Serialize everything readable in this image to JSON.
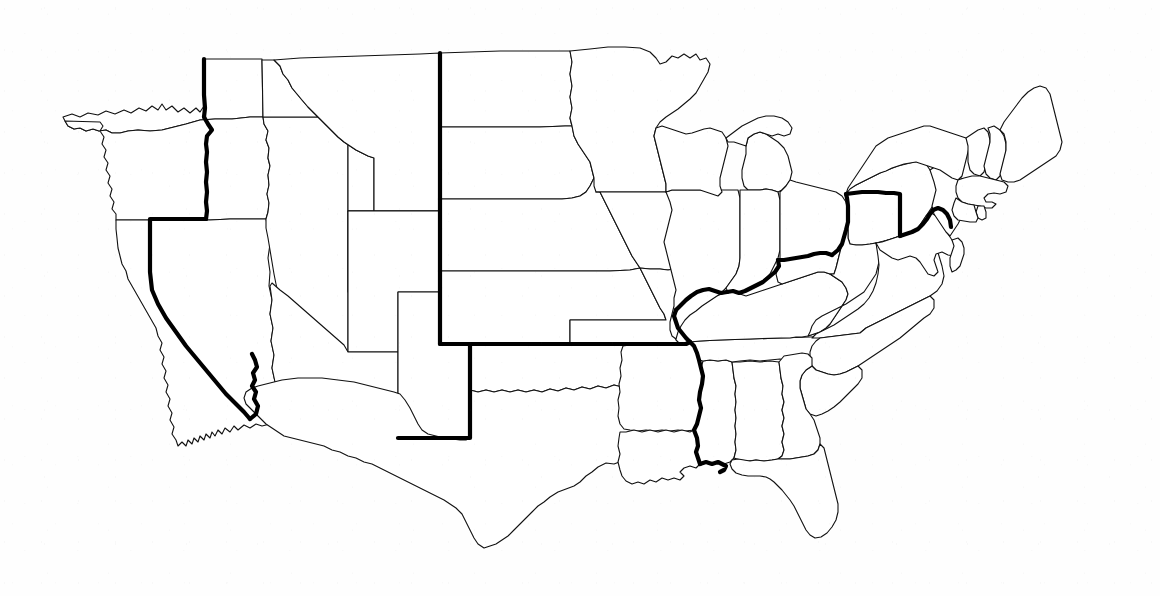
{
  "document": {
    "kind": "map",
    "title": "United States state outline map",
    "subject": "Historic dividing line across the contiguous United States",
    "visible_text": [],
    "has_labels": false,
    "has_legend": false,
    "has_title_text": false,
    "background_color": "#fefefe",
    "paper_appearance": "light scanned white paper with faint speckle"
  },
  "map": {
    "projection_look": "flat contiguous-US outline, no Alaska or Hawaii",
    "extent_px": {
      "left": 58,
      "top": 38,
      "right": 1075,
      "bottom": 548
    },
    "features": [
      {
        "name": "state-boundaries",
        "style": "thin",
        "stroke_color": "#111111",
        "stroke_width_px": 1.1,
        "description": "All interior state borders and the national coastline / international borders drawn as fine black lines on white."
      },
      {
        "name": "historic-divide-line",
        "style": "thick",
        "stroke_color": "#000000",
        "stroke_width_px": 4.2,
        "description": "A single heavy black line traced over existing state borders, running coast to coast and separating northern states from southern states."
      }
    ],
    "divide_line_segments": [
      "California / Nevada border (northeast-southeast diagonal)",
      "California / Arizona border down the Colorado River to the Mexico border",
      "Oregon / Idaho border",
      "Washington / Idaho border",
      "Montana / North Dakota and Montana / South Dakota western borders",
      "Wyoming / South Dakota and Wyoming / Nebraska borders",
      "Colorado / Nebraska border",
      "Colorado / Kansas southern border (east-west along 37 degrees north)",
      "New Mexico / Oklahoma and New Mexico / Texas borders",
      "Kansas / Oklahoma border (Missouri Compromise 36 degrees 30 minutes line)",
      "Missouri southern border with Arkansas",
      "Mississippi River: Arkansas / Tennessee, Arkansas / Mississippi, Louisiana / Mississippi",
      "Louisiana / Mississippi eastern segment toward the Gulf",
      "Ohio River: Illinois / Kentucky, Indiana / Kentucky, Ohio / Kentucky",
      "Ohio / West Virginia border",
      "Pennsylvania / West Virginia and Pennsylvania / Maryland (Mason-Dixon line)",
      "Pennsylvania / Delaware boundary to the Atlantic side"
    ],
    "states_north_of_line": [
      "Washington",
      "Oregon",
      "Idaho",
      "Montana",
      "North Dakota",
      "South Dakota",
      "Wyoming",
      "Nebraska",
      "Colorado",
      "Kansas",
      "Minnesota",
      "Iowa",
      "Missouri",
      "Wisconsin",
      "Illinois",
      "Michigan",
      "Indiana",
      "Ohio",
      "Pennsylvania",
      "New York",
      "New Jersey",
      "Connecticut",
      "Rhode Island",
      "Massachusetts",
      "Vermont",
      "New Hampshire",
      "Maine"
    ],
    "states_south_of_line": [
      "California",
      "Nevada",
      "Utah",
      "Arizona",
      "New Mexico",
      "Texas",
      "Oklahoma",
      "Arkansas",
      "Louisiana",
      "Mississippi",
      "Alabama",
      "Tennessee",
      "Kentucky",
      "West Virginia",
      "Virginia",
      "Maryland",
      "Delaware",
      "North Carolina",
      "South Carolina",
      "Georgia",
      "Florida"
    ],
    "notable_water_bodies_outlined": [
      "Lake Superior",
      "Lake Michigan",
      "Lake Huron",
      "Lake Erie",
      "Lake Ontario",
      "Chesapeake Bay",
      "Gulf of Mexico coastline",
      "Atlantic coastline",
      "Pacific coastline"
    ]
  }
}
